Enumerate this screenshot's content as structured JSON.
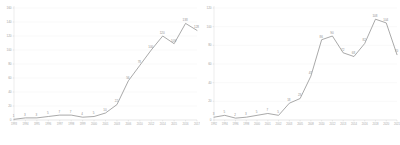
{
  "figure": {
    "name": "two-panel-line-chart-figure",
    "background": "#ffffff",
    "line_color": "#8c8c8c",
    "grid_color": "#ededed",
    "text_color": "#9a9a9a",
    "panel_count": 2
  },
  "chart_data": [
    {
      "id": "left-chart",
      "type": "line",
      "title": "",
      "subtitle": "",
      "xlabel": "",
      "ylabel": "",
      "grid": true,
      "legend": false,
      "legend_position": "none",
      "ylim": [
        0,
        160
      ],
      "yticks": [
        0,
        20,
        40,
        60,
        80,
        100,
        120,
        140,
        160
      ],
      "ytick_labels": [
        "0",
        "20",
        "40",
        "60",
        "80",
        "100",
        "120",
        "140",
        "160"
      ],
      "categories": [
        "1993",
        "1994",
        "1995",
        "1996",
        "1997",
        "1998",
        "1999",
        "2000",
        "2001",
        "2003",
        "2006",
        "2010",
        "2012",
        "2014",
        "2015",
        "2016",
        "2017"
      ],
      "values": [
        1,
        3,
        3,
        5,
        7,
        7,
        4,
        5,
        10,
        22,
        56,
        78,
        100,
        120,
        109,
        138,
        128
      ],
      "point_labels": [
        "1",
        "3",
        "3",
        "5",
        "7",
        "7",
        "4",
        "5",
        "10",
        "22",
        "56",
        "78",
        "100",
        "120",
        "109",
        "138",
        "128"
      ],
      "show_point_labels": true,
      "series": [
        {
          "name": "series-1",
          "color": "#8c8c8c",
          "values": [
            1,
            3,
            3,
            5,
            7,
            7,
            4,
            5,
            10,
            22,
            56,
            78,
            100,
            120,
            109,
            138,
            128
          ]
        }
      ]
    },
    {
      "id": "right-chart",
      "type": "line",
      "title": "",
      "subtitle": "",
      "xlabel": "",
      "ylabel": "",
      "grid": true,
      "legend": false,
      "legend_position": "none",
      "ylim": [
        0,
        120
      ],
      "yticks": [
        0,
        20,
        40,
        60,
        80,
        100,
        120
      ],
      "ytick_labels": [
        "0",
        "20",
        "40",
        "60",
        "80",
        "100",
        "120"
      ],
      "categories": [
        "1992",
        "1994",
        "1996",
        "1998",
        "2000",
        "2001",
        "2002",
        "2003",
        "2005",
        "2008",
        "2010",
        "2012",
        "2013",
        "2014",
        "2016",
        "2018",
        "2020",
        "2021"
      ],
      "values": [
        3,
        5,
        2,
        3,
        5,
        7,
        5,
        18,
        23,
        47,
        86,
        90,
        72,
        68,
        82,
        108,
        104,
        70
      ],
      "point_labels": [
        "3",
        "5",
        "2",
        "3",
        "5",
        "7",
        "5",
        "18",
        "23",
        "47",
        "86",
        "90",
        "72",
        "68",
        "82",
        "108",
        "104",
        "70"
      ],
      "show_point_labels": true,
      "series": [
        {
          "name": "series-1",
          "color": "#8c8c8c",
          "values": [
            3,
            5,
            2,
            3,
            5,
            7,
            5,
            18,
            23,
            47,
            86,
            90,
            72,
            68,
            82,
            108,
            104,
            70
          ]
        }
      ]
    }
  ]
}
